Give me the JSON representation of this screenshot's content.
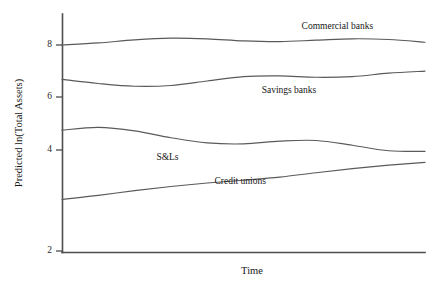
{
  "chart_data": {
    "type": "line",
    "title": "",
    "xlabel": "Time",
    "ylabel": "Predicted ln(Total Assets)",
    "grid": false,
    "legend_position": "inline-labels",
    "ylim": [
      2,
      8.6
    ],
    "yticks": [
      2,
      4,
      6,
      8
    ],
    "ytick_labels": [
      "2",
      "4",
      "6",
      "8"
    ],
    "xlim": [
      0,
      1
    ],
    "xticks": [],
    "xtick_labels": [],
    "x": [
      0,
      0.1,
      0.2,
      0.3,
      0.4,
      0.5,
      0.6,
      0.7,
      0.8,
      0.9,
      1
    ],
    "series": [
      {
        "name": "Commercial banks",
        "label": "Commercial banks",
        "label_x": 0.66,
        "label_y": 8.52,
        "values": [
          8.0,
          8.06,
          8.15,
          8.2,
          8.18,
          8.12,
          8.1,
          8.14,
          8.18,
          8.16,
          8.08
        ]
      },
      {
        "name": "Savings banks",
        "label": "Savings banks",
        "label_x": 0.55,
        "label_y": 6.68,
        "values": [
          7.0,
          6.88,
          6.8,
          6.82,
          6.95,
          7.08,
          7.1,
          7.06,
          7.08,
          7.18,
          7.24
        ]
      },
      {
        "name": "S&Ls",
        "label": "S&Ls",
        "label_x": 0.26,
        "label_y": 4.72,
        "values": [
          5.52,
          5.6,
          5.5,
          5.3,
          5.15,
          5.12,
          5.2,
          5.22,
          5.08,
          4.92,
          4.9
        ]
      },
      {
        "name": "Credit unions",
        "label": "Credit unions",
        "label_x": 0.42,
        "label_y": 4.02,
        "values": [
          3.5,
          3.62,
          3.76,
          3.88,
          3.98,
          4.06,
          4.15,
          4.28,
          4.4,
          4.5,
          4.58
        ]
      }
    ]
  },
  "colors": {
    "line": "#5a5a5a",
    "axis": "#4d4d4d",
    "text": "#161616",
    "background": "#ffffff"
  }
}
